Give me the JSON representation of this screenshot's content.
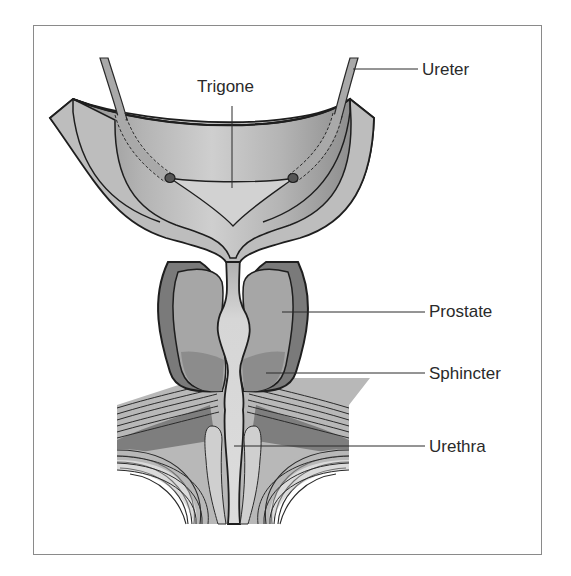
{
  "diagram": {
    "labels": {
      "trigone": "Trigone",
      "ureter": "Ureter",
      "prostate": "Prostate",
      "sphincter": "Sphincter",
      "urethra": "Urethra"
    },
    "colors": {
      "outline": "#1e1e1e",
      "bladder_wall": "#bdbdbd",
      "bladder_inner": "#9e9e9e",
      "trigone_fill": "#d4d4d4",
      "prostate_capsule": "#7a7a7a",
      "prostate": "#a6a6a6",
      "sphincter": "#8c8c8c",
      "urethra": "#d9d9d9",
      "muscle": "#b5b5b5",
      "muscle_dark": "#7c7c7c",
      "frame": "#8a8a8a"
    }
  }
}
